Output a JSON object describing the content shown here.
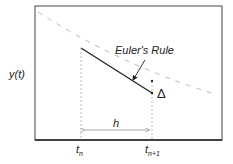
{
  "diagram": {
    "y_axis_label": "y(t)",
    "annotation": "Euler's Rule",
    "delta_symbol": "Δ",
    "step_label": "h",
    "tick_labels": {
      "t_n": {
        "base": "t",
        "sub": "n"
      },
      "t_n1": {
        "base": "t",
        "sub": "n+1"
      }
    },
    "colors": {
      "frame": "#333333",
      "curve": "#bbbbbb",
      "euler_line": "#222222",
      "guides": "#aaaaaa"
    }
  }
}
